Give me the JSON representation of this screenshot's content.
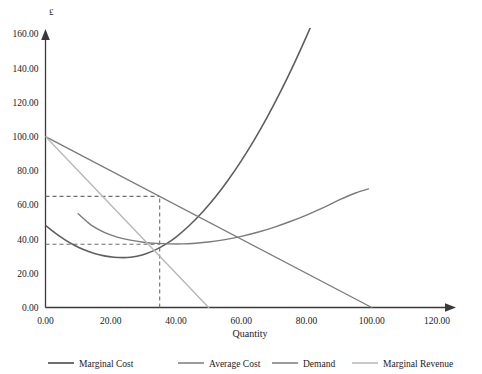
{
  "chart_data": {
    "type": "line",
    "title": "",
    "xlabel": "Quantity",
    "ylabel": "£",
    "xlim": [
      0,
      120
    ],
    "ylim": [
      0,
      160
    ],
    "xticks": [
      "0.00",
      "20.00",
      "40.00",
      "60.00",
      "80.00",
      "100.00",
      "120.00"
    ],
    "xtick_values": [
      0,
      20,
      40,
      60,
      80,
      100,
      120
    ],
    "yticks": [
      "0.00",
      "20.00",
      "40.00",
      "60.00",
      "80.00",
      "100.00",
      "120.00",
      "140.00",
      "160.00"
    ],
    "ytick_values": [
      0,
      20,
      40,
      60,
      80,
      100,
      120,
      140,
      160
    ],
    "grid": false,
    "legend_position": "bottom",
    "series": [
      {
        "name": "Marginal Cost",
        "color": "#5f5f5f",
        "width": 1.6,
        "points": [
          [
            0,
            48
          ],
          [
            3,
            43.5
          ],
          [
            6,
            39.6
          ],
          [
            9,
            36.3
          ],
          [
            12,
            33.6
          ],
          [
            15,
            31.6
          ],
          [
            18,
            30.2
          ],
          [
            21,
            29.4
          ],
          [
            24,
            29.2
          ],
          [
            26,
            29.4
          ],
          [
            28,
            30.0
          ],
          [
            31,
            31.6
          ],
          [
            34,
            34.0
          ],
          [
            37,
            37.2
          ],
          [
            40,
            41.2
          ],
          [
            44,
            47.8
          ],
          [
            48,
            55.6
          ],
          [
            52,
            64.5
          ],
          [
            56,
            74.6
          ],
          [
            60,
            85.8
          ],
          [
            64,
            98.1
          ],
          [
            68,
            111.5
          ],
          [
            72,
            126.1
          ],
          [
            76,
            141.8
          ],
          [
            80,
            158.6
          ],
          [
            84,
            176.5
          ],
          [
            88,
            195.5
          ],
          [
            92,
            215.7
          ],
          [
            93,
            221.0
          ]
        ]
      },
      {
        "name": "Average Cost",
        "color": "#7b7b7b",
        "width": 1.4,
        "points": [
          [
            10,
            54.8
          ],
          [
            14,
            48.2
          ],
          [
            18,
            44.0
          ],
          [
            22,
            41.2
          ],
          [
            26,
            39.4
          ],
          [
            30,
            38.2
          ],
          [
            34,
            37.5
          ],
          [
            38,
            37.2
          ],
          [
            42,
            37.2
          ],
          [
            46,
            37.6
          ],
          [
            50,
            38.3
          ],
          [
            55,
            39.7
          ],
          [
            60,
            41.6
          ],
          [
            65,
            44.0
          ],
          [
            70,
            46.9
          ],
          [
            75,
            50.3
          ],
          [
            80,
            54.1
          ],
          [
            85,
            58.3
          ],
          [
            90,
            62.9
          ],
          [
            95,
            67.0
          ],
          [
            99,
            69.4
          ]
        ]
      },
      {
        "name": "Demand",
        "color": "#7b7b7b",
        "width": 1.4,
        "points": [
          [
            0,
            100
          ],
          [
            100,
            0
          ]
        ]
      },
      {
        "name": "Marginal Revenue",
        "color": "#b8b8b8",
        "width": 1.4,
        "points": [
          [
            0,
            100
          ],
          [
            50,
            0
          ]
        ]
      }
    ],
    "guides": [
      {
        "name": "price-guide",
        "type": "horizontal",
        "value": 65.0,
        "from_x": 0,
        "to_x": 35,
        "color": "#6e6e6e"
      },
      {
        "name": "cost-guide",
        "type": "horizontal",
        "value": 37.0,
        "from_x": 0,
        "to_x": 35,
        "color": "#6e6e6e"
      },
      {
        "name": "quantity-guide",
        "type": "vertical",
        "value": 35.0,
        "from_y": 0,
        "to_y": 65,
        "color": "#6e6e6e"
      }
    ],
    "annotations": []
  },
  "legend": {
    "items": [
      {
        "label": "Marginal Cost",
        "color": "#5f5f5f"
      },
      {
        "label": "Average Cost",
        "color": "#7b7b7b"
      },
      {
        "label": "Demand",
        "color": "#7b7b7b"
      },
      {
        "label": "Marginal Revenue",
        "color": "#b8b8b8"
      }
    ]
  }
}
